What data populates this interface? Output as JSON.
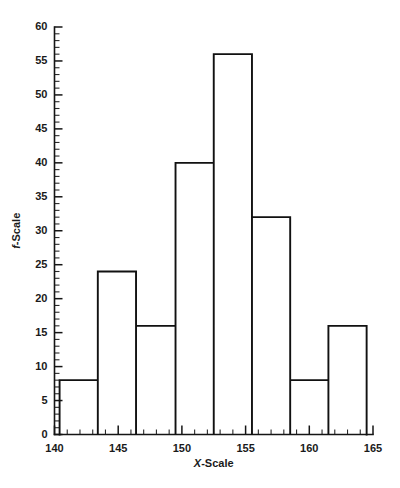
{
  "chart_data": {
    "type": "bar",
    "title": "",
    "subtitle": "",
    "xlabel": "X-Scale",
    "ylabel": "f-Scale",
    "xlim": [
      140,
      165
    ],
    "ylim": [
      0,
      60
    ],
    "grid": false,
    "legend": null,
    "bin_width": 3.03,
    "bin_edges": [
      140.4,
      143.4,
      146.4,
      149.5,
      152.5,
      155.5,
      158.5,
      161.5,
      164.5
    ],
    "categories": [
      "140.4-143.4",
      "143.4-146.4",
      "146.4-149.5",
      "149.5-152.5",
      "152.5-155.5",
      "155.5-158.5",
      "158.5-161.5",
      "161.5-164.5"
    ],
    "values": [
      8,
      24,
      16,
      40,
      56,
      32,
      8,
      16
    ],
    "x_ticks_major": [
      140,
      145,
      150,
      155,
      160,
      165
    ],
    "x_tick_labels": [
      "140",
      "145",
      "150",
      "155",
      "160",
      "165"
    ],
    "x_minor_step": 1,
    "y_ticks_major": [
      0,
      5,
      10,
      15,
      20,
      25,
      30,
      35,
      40,
      45,
      50,
      55,
      60
    ],
    "y_tick_labels": [
      "0",
      "5",
      "10",
      "15",
      "20",
      "25",
      "30",
      "35",
      "40",
      "45",
      "50",
      "55",
      "60"
    ],
    "y_minor_step": 1,
    "colors": {
      "bar_stroke": "#111111",
      "bar_fill": "none",
      "axis": "#151515",
      "text": "#1a1a1a",
      "background": "#ffffff"
    }
  },
  "axis_titles": {
    "x_italic_part": "X",
    "x_rest": "-Scale",
    "y_italic_part": "f",
    "y_rest": "-Scale"
  }
}
